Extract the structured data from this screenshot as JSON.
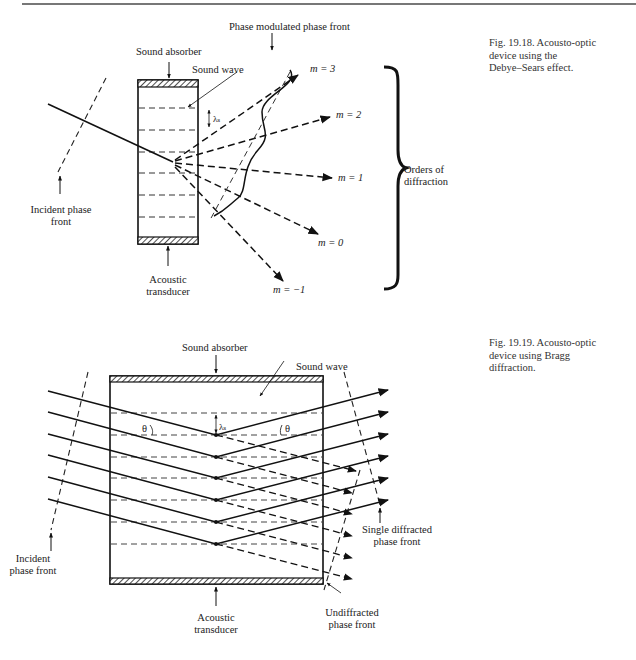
{
  "page": {
    "header_rule": true
  },
  "figures": [
    {
      "id": "fig-19-18",
      "caption": {
        "line1": "Fig. 19.18.   Acousto-optic",
        "line2": "device using the",
        "line3": "Debye–Sears effect."
      },
      "labels": {
        "sound_absorber": "Sound absorber",
        "sound_wave": "Sound wave",
        "phase_modulated_front": "Phase modulated phase front",
        "lambda_s": "λₛ",
        "incident_front_1": "Incident phase",
        "incident_front_2": "front",
        "acoustic_transducer_1": "Acoustic",
        "acoustic_transducer_2": "transducer",
        "orders_1": "Orders of",
        "orders_2": "diffraction"
      },
      "orders": [
        {
          "m": "3",
          "label": "m = 3"
        },
        {
          "m": "2",
          "label": "m = 2"
        },
        {
          "m": "1",
          "label": "m = 1"
        },
        {
          "m": "0",
          "label": "m = 0"
        },
        {
          "m": "-1",
          "label": "m = −1"
        }
      ]
    },
    {
      "id": "fig-19-19",
      "caption": {
        "line1": "Fig. 19.19.   Acousto-optic",
        "line2": "device using Bragg",
        "line3": "diffraction."
      },
      "labels": {
        "sound_absorber": "Sound absorber",
        "sound_wave": "Sound wave",
        "theta_left": "θ",
        "theta_right": "θ",
        "lambda_s": "λₛ",
        "incident_front_1": "Incident",
        "incident_front_2": "phase front",
        "acoustic_transducer_1": "Acoustic",
        "acoustic_transducer_2": "transducer",
        "single_diffracted_1": "Single diffracted",
        "single_diffracted_2": "phase front",
        "undiffracted_1": "Undiffracted",
        "undiffracted_2": "phase front"
      },
      "beam_count": 6
    }
  ]
}
